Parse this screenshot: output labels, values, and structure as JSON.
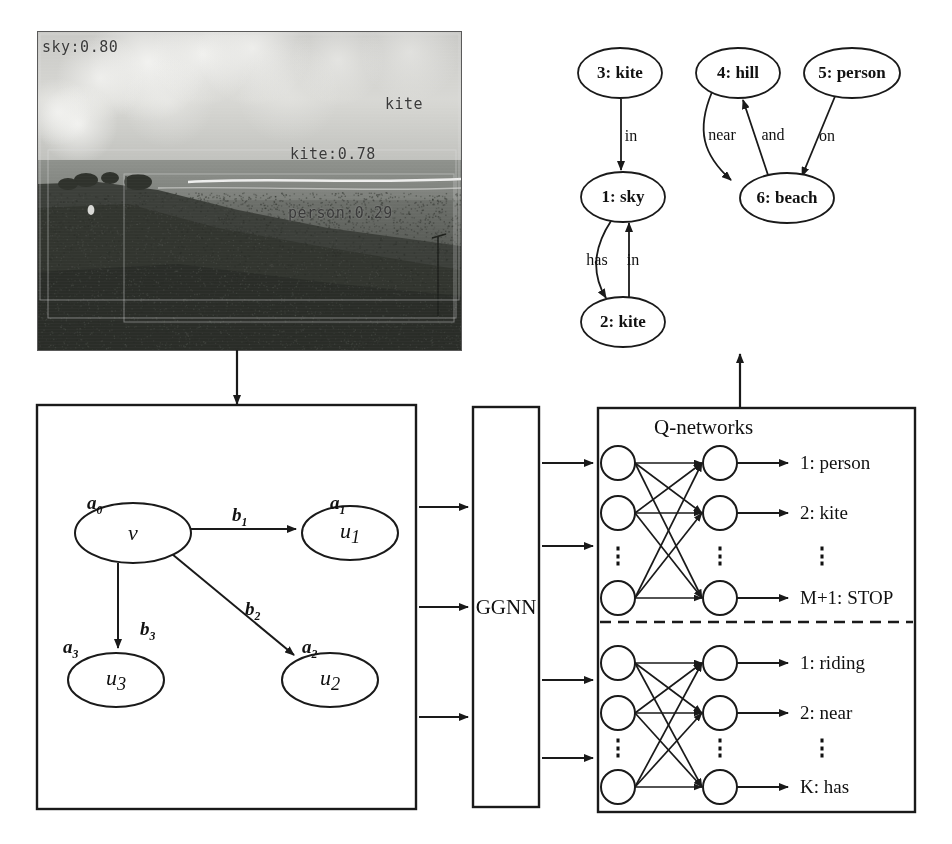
{
  "photo": {
    "alt_name": "beach-scene-photograph",
    "detections": [
      {
        "label": "sky:0.80",
        "x": 42,
        "y": 38
      },
      {
        "label": "kite",
        "x": 385,
        "y": 95
      },
      {
        "label": "kite:0.78",
        "x": 290,
        "y": 145
      },
      {
        "label": "person:0.29",
        "x": 288,
        "y": 204
      }
    ]
  },
  "scene_graph": {
    "nodes": [
      {
        "id": "n3",
        "label": "3: kite",
        "cx": 620,
        "cy": 73,
        "rx": 42,
        "ry": 25
      },
      {
        "id": "n4",
        "label": "4: hill",
        "cx": 738,
        "cy": 73,
        "rx": 42,
        "ry": 25
      },
      {
        "id": "n5",
        "label": "5: person",
        "cx": 852,
        "cy": 73,
        "rx": 48,
        "ry": 25
      },
      {
        "id": "n1",
        "label": "1: sky",
        "cx": 623,
        "cy": 197,
        "rx": 42,
        "ry": 25
      },
      {
        "id": "n6",
        "label": "6: beach",
        "cx": 787,
        "cy": 198,
        "rx": 47,
        "ry": 25
      },
      {
        "id": "n2",
        "label": "2: kite",
        "cx": 623,
        "cy": 322,
        "rx": 42,
        "ry": 25
      }
    ],
    "edges": [
      {
        "from": "3: kite",
        "to": "1: sky",
        "label": "in",
        "lx": 631,
        "ly": 136
      },
      {
        "from": "1: sky",
        "to": "2: kite",
        "label": "has",
        "lx": 597,
        "ly": 260
      },
      {
        "from": "2: kite",
        "to": "1: sky",
        "label": "in",
        "lx": 633,
        "ly": 260
      },
      {
        "from": "4: hill",
        "to": "6: beach",
        "label": "near",
        "lx": 722,
        "ly": 135
      },
      {
        "from": "6: beach",
        "to": "4: hill",
        "label": "and",
        "lx": 773,
        "ly": 135
      },
      {
        "from": "5: person",
        "to": "6: beach",
        "label": "on",
        "lx": 827,
        "ly": 136
      }
    ]
  },
  "graph_box": {
    "name": "input-graph-panel",
    "nodes": [
      {
        "label": "v",
        "annotation": "a",
        "annotation_sub": "0",
        "cx": 133,
        "cy": 533,
        "rx": 58,
        "ry": 30,
        "ax": 87,
        "ay": 492
      },
      {
        "label": "u",
        "sub": "1",
        "annotation": "a",
        "annotation_sub": "1",
        "cx": 350,
        "cy": 533,
        "rx": 48,
        "ry": 27,
        "ax": 330,
        "ay": 492
      },
      {
        "label": "u",
        "sub": "2",
        "annotation": "a",
        "annotation_sub": "2",
        "cx": 330,
        "cy": 680,
        "rx": 48,
        "ry": 27,
        "ax": 302,
        "ay": 636
      },
      {
        "label": "u",
        "sub": "3",
        "annotation": "a",
        "annotation_sub": "3",
        "cx": 116,
        "cy": 680,
        "rx": 48,
        "ry": 27,
        "ax": 63,
        "ay": 636
      }
    ],
    "edges": [
      {
        "label": "b",
        "sub": "1",
        "lx": 232,
        "ly": 504
      },
      {
        "label": "b",
        "sub": "2",
        "lx": 245,
        "ly": 598
      },
      {
        "label": "b",
        "sub": "3",
        "lx": 140,
        "ly": 618
      }
    ]
  },
  "ggnn": {
    "label": "GGNN",
    "input_arrow_count": 3,
    "output_arrow_count": 4
  },
  "q_networks": {
    "title": "Q-networks",
    "object_head": {
      "outputs": [
        "1: person",
        "2: kite",
        "⋮",
        "M+1: STOP"
      ]
    },
    "predicate_head": {
      "outputs": [
        "1: riding",
        "2: near",
        "⋮",
        "K: has"
      ]
    },
    "layer_dots": "⋮"
  },
  "colors": {
    "stroke": "#1a1a1a",
    "background": "#ffffff",
    "detection_text": "#3a3a3a"
  }
}
